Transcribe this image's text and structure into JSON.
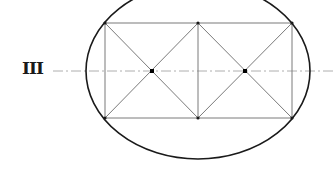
{
  "diagram": {
    "label": "III",
    "colors": {
      "outline": "#1a1a1a",
      "construction": "#7a7a7a",
      "axis": "#9a9a9a"
    },
    "ellipse": {
      "cx": 198,
      "cy": 71,
      "rx": 112,
      "ry": 88
    },
    "axis": {
      "x1": 53,
      "x2": 334,
      "y": 71
    },
    "rectangle": {
      "left": 105,
      "middle": 198,
      "right": 292,
      "top": 23,
      "bottom": 118
    },
    "center_points": [
      {
        "x": 152,
        "y": 71
      },
      {
        "x": 245,
        "y": 71
      }
    ],
    "corner_points": [
      {
        "x": 105,
        "y": 23
      },
      {
        "x": 198,
        "y": 23
      },
      {
        "x": 292,
        "y": 23
      },
      {
        "x": 105,
        "y": 118
      },
      {
        "x": 198,
        "y": 118
      },
      {
        "x": 292,
        "y": 118
      }
    ]
  }
}
